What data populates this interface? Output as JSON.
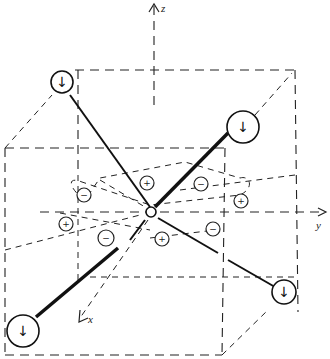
{
  "diagram": {
    "type": "octahedral crystal field schematic",
    "axes": {
      "x_label": "x",
      "y_label": "y",
      "z_label": "z"
    },
    "ligands": [
      {
        "id": "ligand-top-left",
        "symbol": "↓"
      },
      {
        "id": "ligand-top-right",
        "symbol": "↓"
      },
      {
        "id": "ligand-bottom-left",
        "symbol": "↓"
      },
      {
        "id": "ligand-bottom-right",
        "symbol": "↓"
      }
    ],
    "charges": [
      {
        "id": "charge-1",
        "sign": "+"
      },
      {
        "id": "charge-2",
        "sign": "−"
      },
      {
        "id": "charge-3",
        "sign": "−"
      },
      {
        "id": "charge-4",
        "sign": "+"
      },
      {
        "id": "charge-5",
        "sign": "+"
      },
      {
        "id": "charge-6",
        "sign": "−"
      },
      {
        "id": "charge-7",
        "sign": "+"
      },
      {
        "id": "charge-8",
        "sign": "−"
      }
    ]
  }
}
